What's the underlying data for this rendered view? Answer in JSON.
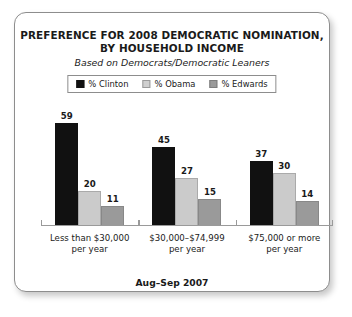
{
  "card": {
    "title_line1": "PREFERENCE FOR 2008 DEMOCRATIC NOMINATION,",
    "title_line2": "BY HOUSEHOLD INCOME",
    "subtitle": "Based on Democrats/Democratic Leaners",
    "footer": "Aug–Sep 2007"
  },
  "legend": {
    "items": [
      {
        "label": "% Clinton",
        "color": "#111111",
        "swatch": "clinton-swatch-icon"
      },
      {
        "label": "% Obama",
        "color": "#cbcbcb",
        "swatch": "obama-swatch-icon"
      },
      {
        "label": "% Edwards",
        "color": "#9a9a9a",
        "swatch": "edwards-swatch-icon"
      }
    ]
  },
  "categories_display": [
    {
      "line1": "Less than $30,000",
      "line2": "per year"
    },
    {
      "line1": "$30,000–$74,999",
      "line2": "per year"
    },
    {
      "line1": "$75,000 or more",
      "line2": "per year"
    }
  ],
  "chart_data": {
    "type": "bar",
    "title": "PREFERENCE FOR 2008 DEMOCRATIC NOMINATION, BY HOUSEHOLD INCOME",
    "subtitle": "Based on Democrats/Democratic Leaners",
    "annotation": "Aug–Sep 2007",
    "xlabel": "",
    "ylabel": "",
    "ylim": [
      0,
      65
    ],
    "grid": false,
    "legend_position": "top-center",
    "categories": [
      "Less than $30,000 per year",
      "$30,000–$74,999 per year",
      "$75,000 or more per year"
    ],
    "series": [
      {
        "name": "% Clinton",
        "color": "#111111",
        "values": [
          59,
          45,
          37
        ]
      },
      {
        "name": "% Obama",
        "color": "#cbcbcb",
        "values": [
          20,
          27,
          30
        ]
      },
      {
        "name": "% Edwards",
        "color": "#9a9a9a",
        "values": [
          11,
          15,
          14
        ]
      }
    ]
  }
}
